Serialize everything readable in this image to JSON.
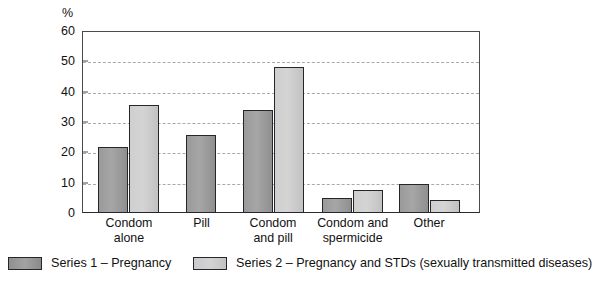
{
  "chart_data": {
    "type": "bar",
    "title": "",
    "xlabel": "",
    "ylabel": "%",
    "ylim": [
      0,
      60
    ],
    "yticks": [
      0,
      10,
      20,
      30,
      40,
      50,
      60
    ],
    "grid": true,
    "legend_position": "bottom",
    "categories": [
      "Condom\nalone",
      "Pill",
      "Condom\nand pill",
      "Condom and\nspermicide",
      "Other"
    ],
    "series": [
      {
        "name": "Series 1 – Pregnancy",
        "color": "#9a9a9a",
        "values": [
          21.7,
          25.7,
          34.0,
          5.0,
          9.5
        ]
      },
      {
        "name": "Series 2 – Pregnancy and STDs (sexually transmitted diseases)",
        "color": "#cfcfcf",
        "values": [
          35.7,
          null,
          48.3,
          7.5,
          4.3
        ]
      }
    ]
  },
  "axis": {
    "unit_label": "%",
    "tick_labels": [
      "60",
      "50",
      "40",
      "30",
      "20",
      "10",
      "0"
    ]
  },
  "legend": {
    "items": [
      {
        "label": "Series 1 – Pregnancy",
        "swatch": "dark-grey-swatch"
      },
      {
        "label": "Series 2 – Pregnancy and STDs (sexually transmitted diseases)",
        "swatch": "light-grey-swatch"
      }
    ]
  }
}
